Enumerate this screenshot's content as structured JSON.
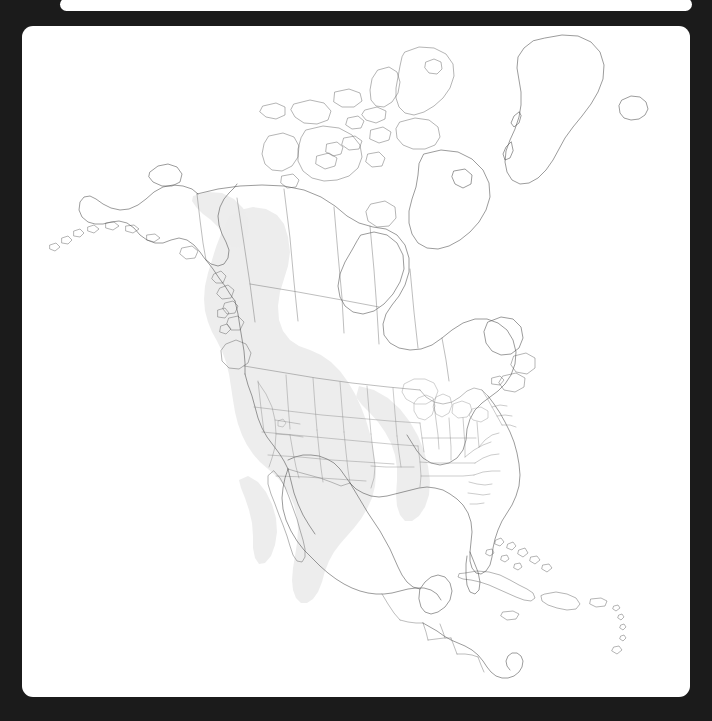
{
  "viewport": {
    "width": 712,
    "height": 721,
    "background_color": "#1b1b1b"
  },
  "top_panel": {
    "visible_sliver_text": "",
    "background_color": "#ffffff"
  },
  "map_card": {
    "background_color": "#ffffff",
    "corner_radius_px": 11,
    "title": "",
    "caption": ""
  },
  "map": {
    "region": "North America",
    "projection_style": "conic",
    "outline_color": "#4a4a4a",
    "border_color": "#6e6e6e",
    "subdivision_color": "#7d7d7d",
    "land_fill": "#ffffff",
    "water_fill": "#ffffff",
    "range_overlay": {
      "label": "",
      "fill_color": "#ececec",
      "coverage_description": "western North America from interior Alaska/Yukon and British Columbia south through the Rocky Mountain and Great Basin states into the Sierra Madre and central Mexico"
    },
    "features_shown": [
      "Alaska",
      "Aleutian Islands",
      "Canadian Arctic Archipelago",
      "Greenland",
      "Iceland",
      "Hudson Bay",
      "Great Lakes",
      "Canadian provincial boundaries",
      "United States state boundaries",
      "Baja California",
      "Gulf of Mexico",
      "Florida",
      "Cuba",
      "Bahamas",
      "Hispaniola",
      "Jamaica",
      "Puerto Rico",
      "Yucatan Peninsula",
      "Central American country boundaries"
    ],
    "legend_entries": [],
    "scale_bar": "",
    "north_arrow": "",
    "graticule_visible": false,
    "labels_visible": false
  }
}
